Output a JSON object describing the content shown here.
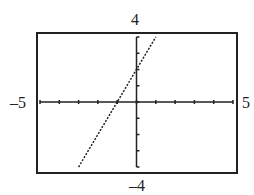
{
  "chart_data": {
    "type": "line",
    "title": "",
    "xlabel": "",
    "ylabel": "",
    "xlim": [
      -5,
      5
    ],
    "ylim": [
      -4,
      4
    ],
    "x_ticks_step": 1,
    "y_ticks_step": 1,
    "grid": false,
    "series": [
      {
        "name": "y = 2x + 2",
        "style": "dotted",
        "x": [
          -3,
          -1,
          0,
          1
        ],
        "y": [
          -4,
          0,
          2,
          4
        ]
      }
    ],
    "window_labels": {
      "ymax": "4",
      "ymin": "–4",
      "xmin": "–5",
      "xmax": "5"
    }
  }
}
